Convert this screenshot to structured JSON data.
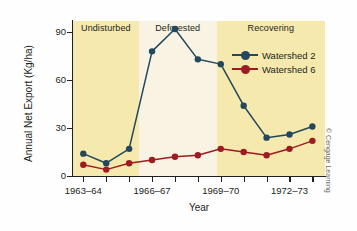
{
  "chart_data": {
    "type": "line",
    "title": "",
    "xlabel": "Year",
    "ylabel": "Annual Net Export (Kg/ha)",
    "ylim": [
      0,
      97
    ],
    "yticks": [
      0,
      30,
      60,
      90
    ],
    "ytick_labels": [
      "0",
      "30",
      "60",
      "90"
    ],
    "grid": false,
    "legend_position": "top-right",
    "x": [
      1,
      2,
      3,
      4,
      5,
      6,
      7,
      8,
      9,
      10,
      11
    ],
    "xtick_positions": [
      1,
      2,
      3,
      4,
      5,
      6,
      7,
      8,
      9,
      10,
      11
    ],
    "xtick_labels": [
      "1963–64",
      "",
      "",
      "1966–67",
      "",
      "",
      "1969–70",
      "",
      "",
      "1972–73",
      ""
    ],
    "series": [
      {
        "name": "Watershed 2",
        "color": "#23475c",
        "marker": "circle",
        "values": [
          14,
          8,
          17,
          78,
          92,
          73,
          70,
          44,
          24,
          26,
          31
        ]
      },
      {
        "name": "Watershed 6",
        "color": "#9e1b23",
        "marker": "circle",
        "values": [
          7,
          4,
          8,
          10,
          12,
          13,
          17,
          15,
          13,
          17,
          22
        ]
      }
    ],
    "bands": [
      {
        "label": "Undisturbed",
        "x_start": 0.55,
        "x_end": 3.42,
        "color": "#f6e9ae"
      },
      {
        "label": "Deforested",
        "x_start": 3.42,
        "x_end": 6.82,
        "color": "#f8f3e2"
      },
      {
        "label": "Recovering",
        "x_start": 6.82,
        "x_end": 11.55,
        "color": "#f6e9ae"
      }
    ]
  },
  "legend": {
    "entries": [
      {
        "label": "Watershed 2",
        "color": "#23475c"
      },
      {
        "label": "Watershed 6",
        "color": "#9e1b23"
      }
    ]
  },
  "credit": "© Cengage Learning"
}
